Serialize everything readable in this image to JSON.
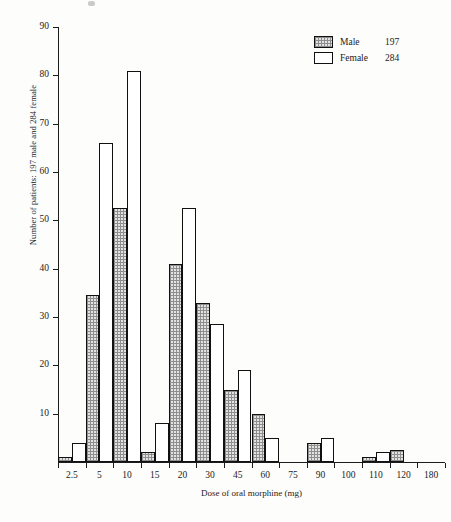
{
  "chart_data": {
    "type": "bar",
    "title": "",
    "xlabel": "Dose of oral morphine (mg)",
    "ylabel": "Number of patients: 197 male and 284 female",
    "categories": [
      "2.5",
      "5",
      "10",
      "15",
      "20",
      "30",
      "45",
      "60",
      "75",
      "90",
      "100",
      "110",
      "120",
      "180"
    ],
    "series": [
      {
        "name": "Male",
        "total": 197,
        "values": [
          1,
          34.5,
          52.5,
          2,
          41,
          33,
          15,
          10,
          0,
          4,
          0,
          1,
          2.5,
          0
        ]
      },
      {
        "name": "Female",
        "total": 284,
        "values": [
          4,
          66,
          81,
          8,
          52.5,
          28.5,
          19,
          5,
          0,
          5,
          0,
          2,
          0,
          0
        ]
      }
    ],
    "ylim": [
      0,
      90
    ],
    "yticks": [
      10,
      20,
      30,
      40,
      50,
      60,
      70,
      80,
      90
    ],
    "grid": false,
    "legend_position": "top-right"
  },
  "legend": {
    "entries": [
      {
        "name": "Male",
        "count": "197",
        "style": "stippled"
      },
      {
        "name": "Female",
        "count": "284",
        "style": "open"
      }
    ]
  },
  "colors": {
    "axis": "#1b1b1b",
    "bar_outline": "#111111",
    "male_fill": "#e2e2e2",
    "female_fill": "#ffffff",
    "background": "#fdfdfb",
    "text": "#232323"
  }
}
